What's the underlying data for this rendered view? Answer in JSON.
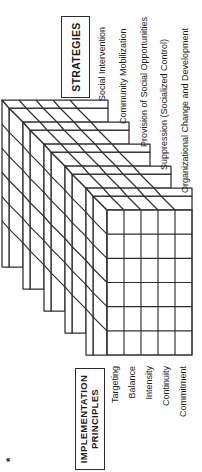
{
  "figure": {
    "strategies_box_label": "STRATEGIES",
    "principles_box_lines": [
      "IMPLEMENTATION",
      "PRINCIPLES"
    ],
    "strategies": [
      "Social Intervention",
      "Community Mobilization",
      "Provision of Social Opportunities",
      "Suppression (Socialized Control)",
      "Organizational Change and Development"
    ],
    "principles": [
      "Targeting",
      "Balance",
      "Intensity",
      "Continuity",
      "Commitment"
    ],
    "footnote_marker": "*",
    "matrix": {
      "slabs": 5,
      "columns": 6,
      "rows": 5
    },
    "colors": {
      "line": "#2e2e2e",
      "text": "#1c1c1c",
      "background": "#ffffff"
    }
  }
}
